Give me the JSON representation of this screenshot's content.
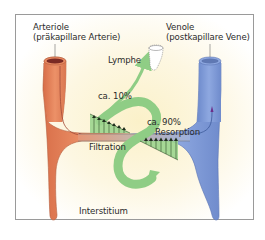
{
  "labels": {
    "arteriole_title": "Arteriole",
    "arteriole_subtitle": "(präkapillare Arterie)",
    "venule_title": "Venole",
    "venule_subtitle": "(postkapillare Vene)",
    "lymph": "Lymphe",
    "lymph_percent": "ca. 10%",
    "reabsorb_percent": "ca. 90%",
    "filtration": "Filtration",
    "resorption": "Resorption",
    "interstitium": "Interstitium"
  },
  "colors": {
    "arteriole": "#e8875e",
    "venule": "#7f9ad6",
    "fluid_arrow": "#8fcd85",
    "pressure_triangles": "#9cd58e",
    "background": "#fdf6de",
    "frame_border": "#9a9a9a"
  },
  "icons": {
    "lymph_vessel": "lymph-vessel-icon",
    "flow_arrow": "flow-arrow-icon"
  }
}
